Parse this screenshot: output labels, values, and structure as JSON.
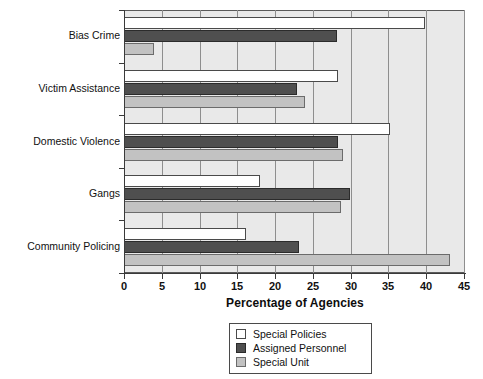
{
  "chart_data": {
    "type": "bar",
    "orientation": "horizontal",
    "title": "",
    "xlabel": "Percentage of Agencies",
    "ylabel": "",
    "xlim": [
      0,
      45
    ],
    "xticks": [
      0,
      5,
      10,
      15,
      20,
      25,
      30,
      35,
      40,
      45
    ],
    "xtick_labels": [
      "0",
      "5",
      "10",
      "15",
      "20",
      "25",
      "30",
      "35",
      "40",
      "45"
    ],
    "grid": "vertical",
    "legend_position": "bottom-center",
    "categories": [
      "Bias Crime",
      "Victim Assistance",
      "Domestic Violence",
      "Gangs",
      "Community Policing"
    ],
    "series": [
      {
        "name": "Special Policies",
        "color": "#ffffff",
        "values": [
          39.8,
          28.3,
          35.2,
          18.0,
          16.2
        ]
      },
      {
        "name": "Assigned Personnel",
        "color": "#4f4f4f",
        "values": [
          28.2,
          22.9,
          28.3,
          29.9,
          23.1
        ]
      },
      {
        "name": "Special Unit",
        "color": "#c2c2c2",
        "values": [
          4.0,
          23.9,
          29.0,
          28.7,
          43.1
        ]
      }
    ]
  },
  "axis": {
    "x_title": "Percentage of Agencies"
  },
  "legend": {
    "entries": [
      {
        "label": "Special Policies"
      },
      {
        "label": "Assigned Personnel"
      },
      {
        "label": "Special Unit"
      }
    ]
  },
  "colors": {
    "plot_background": "#e9e9e9",
    "gridline": "#8e8e8e",
    "axis": "#3a3a3a",
    "special_policies": "#ffffff",
    "assigned_personnel": "#4f4f4f",
    "special_unit": "#c2c2c2"
  }
}
